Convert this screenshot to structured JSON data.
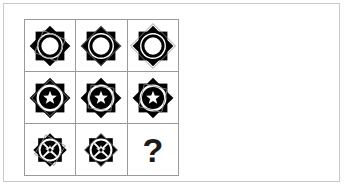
{
  "puzzle": {
    "type": "matrix-reasoning",
    "rows": 3,
    "columns": 3,
    "frame_color": "#c9c9c9",
    "grid_line_color": "#9a9a9a",
    "background_color": "#ffffff",
    "figure_fill_color": "#000000",
    "overlay_outline_color": "#8c8c8c",
    "missing_cell_label": "?",
    "cells": [
      {
        "id": "cell-r1c1",
        "row": 1,
        "column": 1,
        "rosette": "eight-point-rosette",
        "rosette_scale": 1.0,
        "center_motif": "white-ring",
        "overlay_shape": "thin-square-outline",
        "overlay_rotation_deg": 22,
        "overlay_scale": 0.82,
        "label": ""
      },
      {
        "id": "cell-r1c2",
        "row": 1,
        "column": 2,
        "rosette": "eight-point-rosette",
        "rosette_scale": 1.0,
        "center_motif": "white-ring",
        "overlay_shape": "thin-square-outline",
        "overlay_rotation_deg": 45,
        "overlay_scale": 0.96,
        "label": ""
      },
      {
        "id": "cell-r1c3",
        "row": 1,
        "column": 3,
        "rosette": "eight-point-rosette",
        "rosette_scale": 1.0,
        "center_motif": "white-ring",
        "overlay_shape": "thin-square-outline",
        "overlay_rotation_deg": 45,
        "overlay_scale": 1.1,
        "label": ""
      },
      {
        "id": "cell-r2c1",
        "row": 2,
        "column": 1,
        "rosette": "eight-point-rosette",
        "rosette_scale": 1.0,
        "center_motif": "black-disc-white-star",
        "overlay_shape": "thin-square-outline",
        "overlay_rotation_deg": 45,
        "overlay_scale": 0.9,
        "label": ""
      },
      {
        "id": "cell-r2c2",
        "row": 2,
        "column": 2,
        "rosette": "eight-point-rosette",
        "rosette_scale": 1.0,
        "center_motif": "black-disc-white-star",
        "overlay_shape": "thin-square-outline",
        "overlay_rotation_deg": 8,
        "overlay_scale": 0.8,
        "label": ""
      },
      {
        "id": "cell-r2c3",
        "row": 2,
        "column": 3,
        "rosette": "eight-point-rosette",
        "rosette_scale": 1.0,
        "center_motif": "black-disc-white-star",
        "overlay_shape": "thin-square-outline",
        "overlay_rotation_deg": 14,
        "overlay_scale": 0.82,
        "label": ""
      },
      {
        "id": "cell-r3c1",
        "row": 3,
        "column": 1,
        "rosette": "eight-point-rosette",
        "rosette_scale": 0.82,
        "center_motif": "black-disc-white-star-spokes",
        "overlay_shape": "thin-square-outline",
        "overlay_rotation_deg": 30,
        "overlay_scale": 0.95,
        "label": ""
      },
      {
        "id": "cell-r3c2",
        "row": 3,
        "column": 2,
        "rosette": "eight-point-rosette",
        "rosette_scale": 0.82,
        "center_motif": "black-disc-white-star-spokes",
        "overlay_shape": "thin-square-outline",
        "overlay_rotation_deg": 45,
        "overlay_scale": 0.98,
        "label": ""
      },
      {
        "id": "cell-r3c3",
        "row": 3,
        "column": 3,
        "rosette": "none",
        "rosette_scale": 0,
        "center_motif": "none",
        "overlay_shape": "none",
        "overlay_rotation_deg": 0,
        "overlay_scale": 0,
        "label": "?"
      }
    ]
  }
}
